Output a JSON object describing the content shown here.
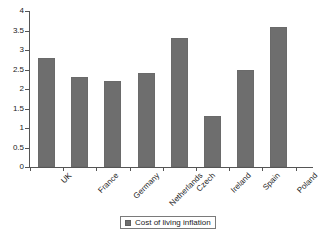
{
  "chart_data": {
    "type": "bar",
    "title": "",
    "subtitle": "",
    "xlabel": "",
    "ylabel": "",
    "categories": [
      "UK",
      "France",
      "Germany",
      "Netherlands",
      "Czech",
      "Ireland",
      "Spain",
      "Poland"
    ],
    "values": [
      2.8,
      2.3,
      2.2,
      2.4,
      3.3,
      1.3,
      2.5,
      3.6
    ],
    "series": [
      {
        "name": "Cost of living inflation",
        "values": [
          2.8,
          2.3,
          2.2,
          2.4,
          3.3,
          1.3,
          2.5,
          3.6
        ],
        "color": "#6e6e6e"
      }
    ],
    "ylim": [
      0,
      4
    ],
    "ytick_step": 0.5,
    "ytick_labels": [
      "0",
      "0.5",
      "1",
      "1.5",
      "2",
      "2.5",
      "3",
      "3.5",
      "4"
    ],
    "ytick_values": [
      0,
      0.5,
      1,
      1.5,
      2,
      2.5,
      3,
      3.5,
      4
    ],
    "grid": false,
    "legend_position": "bottom-center",
    "bar_color": "#6e6e6e",
    "axis_color": "#555555",
    "background": "#ffffff",
    "xtick_label_rotation": -45
  },
  "legend": {
    "entries": [
      {
        "label": "Cost of living inflation",
        "color": "#6e6e6e"
      }
    ]
  }
}
